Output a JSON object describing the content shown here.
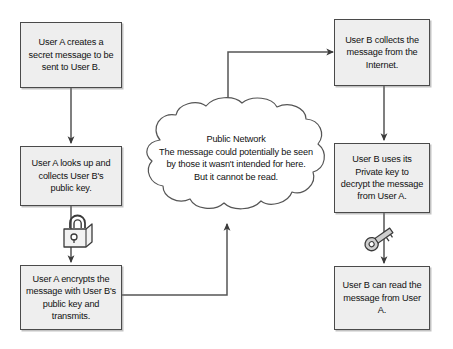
{
  "diagram": {
    "style": {
      "node_fill": "#eeeeee",
      "node_border": "#4a4a4a",
      "edge_color": "#555555",
      "cloud_border": "#555555",
      "text_color": "#111111"
    },
    "nodes": [
      {
        "id": "n1",
        "name": "user-a-creates-message",
        "text": "User A creates a secret message to be sent to User B."
      },
      {
        "id": "n2",
        "name": "user-a-collects-public-key",
        "text": "User A looks up and collects User B's public key."
      },
      {
        "id": "n3",
        "name": "user-a-encrypts-and-transmits",
        "text": "User A encrypts the message with User B's public key and transmits."
      },
      {
        "id": "n4",
        "name": "user-b-collects-message",
        "text": "User B collects the message from the Internet."
      },
      {
        "id": "n5",
        "name": "user-b-decrypts-message",
        "text": "User B uses its Private key to decrypt the message from User A."
      },
      {
        "id": "n6",
        "name": "user-b-reads-message",
        "text": "User B can read the message from User A."
      }
    ],
    "cloud": {
      "name": "public-network-cloud",
      "text": "Public Network\nThe message could potentially be seen\nby those it wasn't intended for here.\nBut it cannot be read."
    },
    "icons": [
      {
        "name": "padlock-icon",
        "label": "padlock"
      },
      {
        "name": "key-icon",
        "label": "key"
      }
    ]
  }
}
